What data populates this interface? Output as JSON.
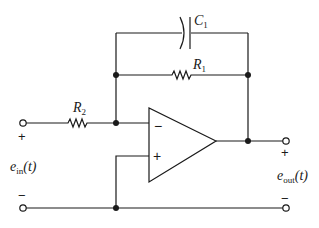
{
  "diagram": {
    "type": "op-amp circuit",
    "components": {
      "capacitor": {
        "label": "C",
        "subscript": "1"
      },
      "feedback_resistor": {
        "label": "R",
        "subscript": "1"
      },
      "input_resistor": {
        "label": "R",
        "subscript": "2"
      },
      "op_amp": {
        "inverting_sign": "−",
        "noninverting_sign": "+"
      }
    },
    "input": {
      "label": "e",
      "subscript": "in",
      "arg": "(t)",
      "plus": "+",
      "minus": "−"
    },
    "output": {
      "label": "e",
      "subscript": "out",
      "arg": "(t)",
      "plus": "+",
      "minus": "−"
    },
    "colors": {
      "line": "#1a1a1a",
      "background": "#ffffff"
    }
  }
}
